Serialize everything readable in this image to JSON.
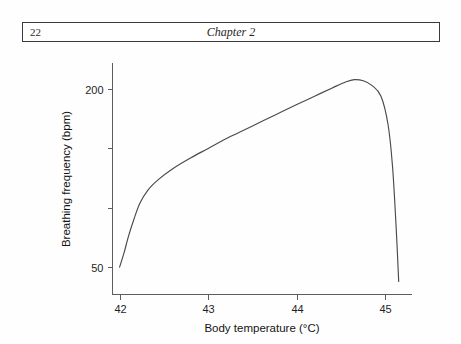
{
  "header": {
    "page_number": "22",
    "chapter_title": "Chapter 2"
  },
  "chart_data": {
    "type": "line",
    "title": "",
    "xlabel": "Body temperature (°C)",
    "ylabel": "Breathing frequency (bpm)",
    "xlim": [
      41.92,
      45.3
    ],
    "ylim": [
      27,
      222
    ],
    "grid": false,
    "legend": null,
    "x_ticks": [
      42,
      43,
      44,
      45
    ],
    "x_tick_labels": [
      "42",
      "43",
      "44",
      "45"
    ],
    "y_ticks": [
      50,
      100,
      150,
      200
    ],
    "y_tick_labels": [
      "50",
      "",
      "",
      "200"
    ],
    "series": [
      {
        "name": "Breathing frequency vs body temperature",
        "x": [
          42.0,
          42.05,
          42.1,
          42.16,
          42.23,
          42.32,
          42.44,
          42.6,
          42.8,
          43.0,
          43.25,
          43.5,
          43.75,
          44.0,
          44.2,
          44.4,
          44.55,
          44.65,
          44.75,
          44.85,
          44.95,
          45.03,
          45.08,
          45.12,
          45.15
        ],
        "y": [
          50,
          62,
          76,
          90,
          104,
          115,
          124,
          133,
          142,
          150,
          160,
          169,
          178,
          187,
          194,
          201,
          206,
          208,
          207,
          203,
          194,
          170,
          135,
          85,
          38
        ]
      }
    ]
  },
  "axis_geometry": {
    "x_pixels": [
      119,
      208,
      297,
      385
    ],
    "y_pixels": [
      268,
      208,
      148,
      90
    ]
  }
}
